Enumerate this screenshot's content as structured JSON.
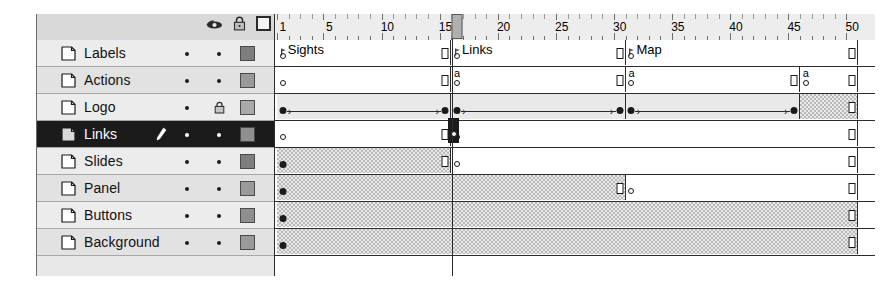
{
  "panel": {
    "name": "flash-timeline",
    "ruler": {
      "labels": [
        1,
        5,
        10,
        15,
        20,
        25,
        30,
        35,
        40,
        45,
        50
      ],
      "total_frames": 50,
      "playhead_frame": 16
    },
    "columns": {
      "eye_icon": "eye-icon",
      "lock_icon": "lock-icon",
      "outline_icon": "outline-square-icon"
    },
    "layers": [
      {
        "name": "Labels",
        "visible": true,
        "locked": false,
        "outline_color": "#7e7e7e",
        "selected": false
      },
      {
        "name": "Actions",
        "visible": true,
        "locked": false,
        "outline_color": "#9a9a9a",
        "selected": false
      },
      {
        "name": "Logo",
        "visible": true,
        "locked": true,
        "outline_color": "#a9a9a9",
        "selected": false
      },
      {
        "name": "Links",
        "visible": true,
        "locked": false,
        "outline_color": "#8f8f8f",
        "selected": true
      },
      {
        "name": "Slides",
        "visible": true,
        "locked": false,
        "outline_color": "#7e7e7e",
        "selected": false
      },
      {
        "name": "Panel",
        "visible": true,
        "locked": false,
        "outline_color": "#9a9a9a",
        "selected": false
      },
      {
        "name": "Buttons",
        "visible": true,
        "locked": false,
        "outline_color": "#8f8f8f",
        "selected": false
      },
      {
        "name": "Background",
        "visible": true,
        "locked": false,
        "outline_color": "#9a9a9a",
        "selected": false
      }
    ],
    "frame_labels": [
      {
        "layer": "Labels",
        "frame": 1,
        "text": "Sights"
      },
      {
        "layer": "Labels",
        "frame": 16,
        "text": "Links"
      },
      {
        "layer": "Labels",
        "frame": 31,
        "text": "Map"
      }
    ],
    "tracks": [
      {
        "layer": "Labels",
        "spans": [
          {
            "from": 1,
            "to": 15,
            "fill": "white"
          },
          {
            "from": 16,
            "to": 30,
            "fill": "white"
          },
          {
            "from": 31,
            "to": 50,
            "fill": "white"
          }
        ],
        "keyframes": [
          {
            "frame": 1,
            "type": "hollow"
          },
          {
            "frame": 16,
            "type": "hollow"
          },
          {
            "frame": 31,
            "type": "hollow"
          }
        ],
        "end_frames": [
          15,
          30,
          50
        ]
      },
      {
        "layer": "Actions",
        "spans": [
          {
            "from": 1,
            "to": 15,
            "fill": "white"
          },
          {
            "from": 16,
            "to": 30,
            "fill": "white"
          },
          {
            "from": 31,
            "to": 45,
            "fill": "white"
          },
          {
            "from": 46,
            "to": 50,
            "fill": "white"
          }
        ],
        "keyframes": [
          {
            "frame": 1,
            "type": "hollow"
          },
          {
            "frame": 16,
            "type": "hollow",
            "script": "a"
          },
          {
            "frame": 31,
            "type": "hollow",
            "script": "a"
          },
          {
            "frame": 46,
            "type": "hollow",
            "script": "a"
          }
        ],
        "end_frames": [
          15,
          30,
          45,
          50
        ]
      },
      {
        "layer": "Logo",
        "spans": [
          {
            "from": 1,
            "to": 15,
            "fill": "tween"
          },
          {
            "from": 16,
            "to": 30,
            "fill": "tween"
          },
          {
            "from": 31,
            "to": 45,
            "fill": "tween"
          },
          {
            "from": 46,
            "to": 50,
            "fill": "hatch"
          }
        ],
        "keyframes": [
          {
            "frame": 1,
            "type": "solid"
          },
          {
            "frame": 15,
            "type": "solid"
          },
          {
            "frame": 16,
            "type": "solid"
          },
          {
            "frame": 30,
            "type": "solid"
          },
          {
            "frame": 31,
            "type": "solid"
          },
          {
            "frame": 45,
            "type": "solid"
          }
        ],
        "tweens": [
          {
            "from": 1,
            "to": 15
          },
          {
            "from": 16,
            "to": 30
          },
          {
            "from": 31,
            "to": 45
          }
        ],
        "end_frames": [
          50
        ]
      },
      {
        "layer": "Links",
        "spans": [
          {
            "from": 1,
            "to": 15,
            "fill": "white"
          },
          {
            "from": 16,
            "to": 50,
            "fill": "white"
          }
        ],
        "keyframes": [
          {
            "frame": 1,
            "type": "hollow"
          },
          {
            "frame": 16,
            "type": "hollow"
          }
        ],
        "end_frames": [
          15,
          50
        ]
      },
      {
        "layer": "Slides",
        "spans": [
          {
            "from": 1,
            "to": 15,
            "fill": "hatch"
          },
          {
            "from": 16,
            "to": 50,
            "fill": "white"
          }
        ],
        "keyframes": [
          {
            "frame": 1,
            "type": "solid"
          },
          {
            "frame": 16,
            "type": "hollow"
          }
        ],
        "end_frames": [
          15,
          50
        ]
      },
      {
        "layer": "Panel",
        "spans": [
          {
            "from": 1,
            "to": 30,
            "fill": "hatch"
          },
          {
            "from": 31,
            "to": 50,
            "fill": "white"
          }
        ],
        "keyframes": [
          {
            "frame": 1,
            "type": "solid"
          },
          {
            "frame": 31,
            "type": "hollow"
          }
        ],
        "end_frames": [
          30,
          50
        ]
      },
      {
        "layer": "Buttons",
        "spans": [
          {
            "from": 1,
            "to": 50,
            "fill": "hatch"
          }
        ],
        "keyframes": [
          {
            "frame": 1,
            "type": "solid"
          }
        ],
        "end_frames": [
          50
        ]
      },
      {
        "layer": "Background",
        "spans": [
          {
            "from": 1,
            "to": 50,
            "fill": "hatch"
          }
        ],
        "keyframes": [
          {
            "frame": 1,
            "type": "solid"
          }
        ],
        "end_frames": [
          50
        ]
      }
    ]
  }
}
